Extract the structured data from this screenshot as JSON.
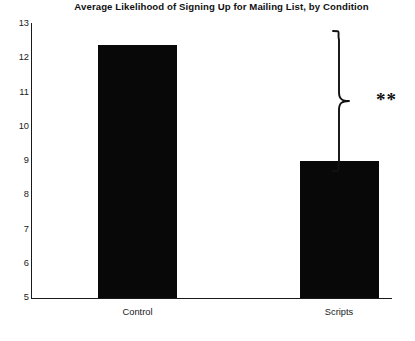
{
  "chart_data": {
    "type": "bar",
    "title": "Average Likelihood of Signing Up for Mailing List, by Condition",
    "xlabel": "",
    "ylabel": "",
    "categories": [
      "Control",
      "Scripts"
    ],
    "values": [
      12.4,
      9.0
    ],
    "ylim": [
      5,
      13
    ],
    "yticks": [
      "13",
      "12",
      "11",
      "10",
      "9",
      "8",
      "7",
      "6",
      "5"
    ],
    "ytick_values": [
      13,
      12,
      11,
      10,
      9,
      8,
      7,
      6,
      5
    ],
    "grid": false,
    "legend": false,
    "bar_color": "#080808",
    "axis_color": "#1a1a1a",
    "annotations": [
      {
        "type": "significance-brace",
        "label": "**",
        "spans": [
          "Control",
          "Scripts"
        ]
      }
    ]
  },
  "axis": {
    "y_ticks": [
      "13",
      "12",
      "11",
      "10",
      "9",
      "8",
      "7",
      "6",
      "5"
    ],
    "x_ticks": [
      "Control",
      "Scripts"
    ]
  },
  "annotation": {
    "significance_label": "**"
  }
}
